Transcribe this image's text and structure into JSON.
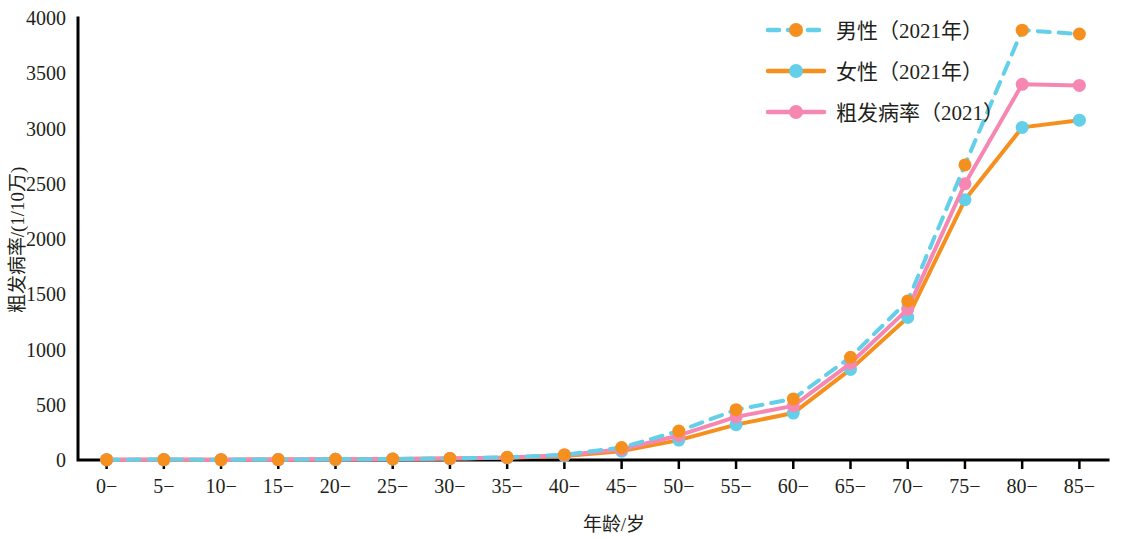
{
  "chart_data": {
    "type": "line",
    "title": "",
    "xlabel": "年龄/岁",
    "ylabel": "粗发病率/(1/10万)",
    "categories": [
      "0−",
      "5−",
      "10−",
      "15−",
      "20−",
      "25−",
      "30−",
      "35−",
      "40−",
      "45−",
      "50−",
      "55−",
      "60−",
      "65−",
      "70−",
      "75−",
      "80−",
      "85−"
    ],
    "xtick_labels": [
      "0−",
      "5−",
      "10−",
      "15−",
      "20−",
      "25−",
      "30−",
      "35−",
      "40−",
      "45−",
      "50−",
      "55−",
      "60−",
      "65−",
      "70−",
      "75−",
      "80−",
      "85−"
    ],
    "ytick_labels": [
      "0",
      "500",
      "1000",
      "1500",
      "2000",
      "2500",
      "3000",
      "3500",
      "4000"
    ],
    "yticks": [
      0,
      500,
      1000,
      1500,
      2000,
      2500,
      3000,
      3500,
      4000
    ],
    "ylim": [
      0,
      4000
    ],
    "grid": false,
    "legend_position": "top-right",
    "series": [
      {
        "name": "男性（2021年）",
        "line_color": "#63cfe8",
        "marker_color": "#f5901e",
        "line_style": "dashed",
        "values": [
          3,
          4,
          3,
          4,
          6,
          9,
          14,
          24,
          48,
          113,
          262,
          455,
          553,
          930,
          1440,
          2670,
          3890,
          3855
        ]
      },
      {
        "name": "女性（2021年）",
        "line_color": "#f5901e",
        "marker_color": "#63cfe8",
        "line_style": "solid",
        "values": [
          3,
          3,
          3,
          4,
          6,
          9,
          13,
          20,
          37,
          80,
          180,
          320,
          425,
          820,
          1290,
          2355,
          3010,
          3075
        ]
      },
      {
        "name": "粗发病率（2021）",
        "line_color": "#f687b3",
        "marker_color": "#f687b3",
        "line_style": "solid",
        "values": [
          3,
          4,
          3,
          4,
          6,
          9,
          13,
          22,
          43,
          97,
          222,
          390,
          490,
          875,
          1365,
          2500,
          3400,
          3390
        ]
      }
    ]
  },
  "legend": {
    "items": [
      {
        "label": "男性（2021年）"
      },
      {
        "label": "女性（2021年）"
      },
      {
        "label": "粗发病率（2021）"
      }
    ]
  }
}
